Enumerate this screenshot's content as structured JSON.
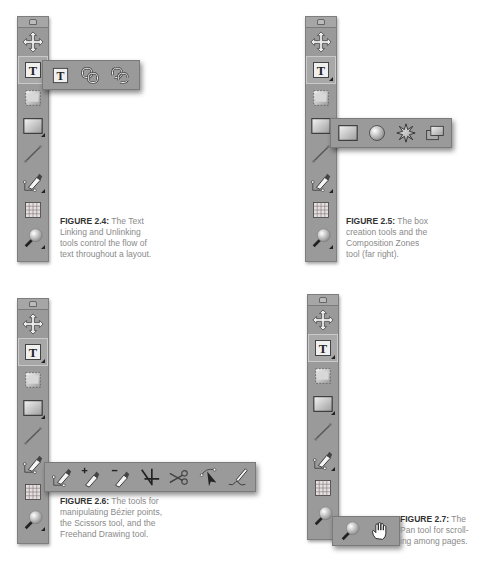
{
  "colors": {
    "toolbar_bg": "#9a9a9a",
    "toolbar_border": "#7e7e7e",
    "caption_text": "#8a8a8a",
    "caption_label": "#333333"
  },
  "toolbar_tools": [
    {
      "name": "item-tool",
      "icon": "move-arrows-icon"
    },
    {
      "name": "text-content-tool",
      "icon": "text-t-icon"
    },
    {
      "name": "picture-content-tool",
      "icon": "picture-box-icon"
    },
    {
      "name": "rectangle-box-tool",
      "icon": "rectangle-icon"
    },
    {
      "name": "line-tool",
      "icon": "line-icon"
    },
    {
      "name": "bezier-pen-tool",
      "icon": "pen-icon"
    },
    {
      "name": "table-tool",
      "icon": "table-grid-icon"
    },
    {
      "name": "zoom-tool",
      "icon": "magnifier-icon"
    }
  ],
  "figures": [
    {
      "id": "2.4",
      "label": "FIGURE 2.4:",
      "caption_lines": [
        "The Text",
        "Linking and Unlinking",
        "tools control the flow of",
        "text throughout a layout."
      ],
      "flyout_tools": [
        "text-content-icon",
        "text-linking-icon",
        "text-unlinking-icon"
      ]
    },
    {
      "id": "2.5",
      "label": "FIGURE 2.5:",
      "caption_lines": [
        "The box",
        "creation tools and the",
        "Composition Zones",
        "tool (far right)."
      ],
      "flyout_tools": [
        "rectangle-box-icon",
        "oval-box-icon",
        "starburst-icon",
        "composition-zones-icon"
      ]
    },
    {
      "id": "2.6",
      "label": "FIGURE 2.6:",
      "caption_lines": [
        "The tools for",
        "manipulating Bézier points,",
        "the Scissors tool, and the",
        "Freehand Drawing tool."
      ],
      "flyout_tools": [
        "bezier-pen-icon",
        "add-point-icon",
        "delete-point-icon",
        "convert-point-icon",
        "scissors-icon",
        "select-point-icon",
        "freehand-drawing-icon"
      ]
    },
    {
      "id": "2.7",
      "label": "FIGURE 2.7:",
      "caption_lines": [
        "The",
        "Pan tool for scroll-",
        "ing among pages."
      ],
      "flyout_tools": [
        "zoom-icon",
        "pan-hand-icon"
      ]
    }
  ]
}
